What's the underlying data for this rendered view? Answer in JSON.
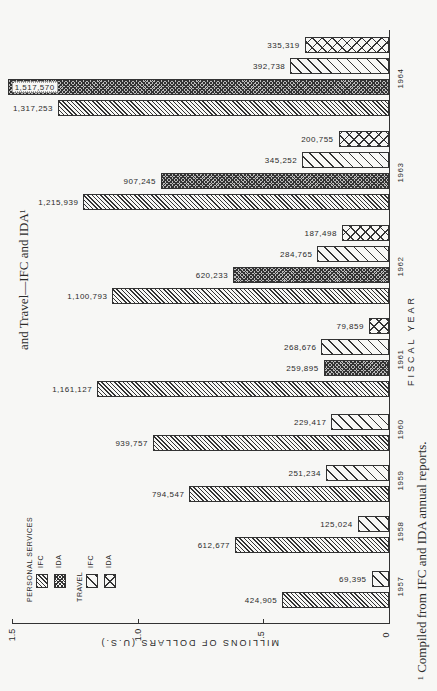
{
  "title": "and Travel—IFC and IDA¹",
  "footnote": "¹ Compiled from IFC and IDA annual reports.",
  "axis": {
    "value_label": "MILLIONS OF DOLLARS (U.S.)",
    "category_label": "FISCAL YEAR",
    "ticks": [
      "0",
      ".5",
      "1.0",
      "1.5"
    ]
  },
  "legend": {
    "group1": "PERSONAL SERVICES",
    "group2": "TRAVEL",
    "items": [
      {
        "label": "IFC",
        "pattern": "pat-ps-ifc"
      },
      {
        "label": "IDA",
        "pattern": "pat-ps-ida"
      },
      {
        "label": "IFC",
        "pattern": "pat-tr-ifc"
      },
      {
        "label": "IDA",
        "pattern": "pat-tr-ida"
      }
    ]
  },
  "colors": {
    "ink": "#333333",
    "paper": "#f7f7f5"
  },
  "chart_data": {
    "type": "bar",
    "orientation": "horizontal (page rotated 90°)",
    "xlabel": "FISCAL YEAR",
    "ylabel": "MILLIONS OF DOLLARS (U.S.)",
    "ylim": [
      0,
      1.5
    ],
    "yticks": [
      0,
      0.5,
      1.0,
      1.5
    ],
    "grid": false,
    "legend_position": "upper-left (rotated)",
    "categories": [
      "1957",
      "1958",
      "1959",
      "1960",
      "1961",
      "1962",
      "1963",
      "1964"
    ],
    "series": [
      {
        "name": "Personal Services — IFC",
        "values": [
          424905,
          612677,
          794547,
          939757,
          1161127,
          1100793,
          1215939,
          1317253
        ]
      },
      {
        "name": "Personal Services — IDA",
        "values": [
          null,
          null,
          null,
          null,
          259895,
          620233,
          907245,
          1517570
        ]
      },
      {
        "name": "Travel — IFC",
        "values": [
          69395,
          125024,
          251234,
          229417,
          268676,
          284765,
          345252,
          392738
        ]
      },
      {
        "name": "Travel — IDA",
        "values": [
          null,
          null,
          null,
          null,
          79859,
          187498,
          200755,
          335319
        ]
      }
    ],
    "value_labels": {
      "1957": [
        "424,905",
        null,
        "69,395",
        null
      ],
      "1958": [
        "612,677",
        null,
        "125,024",
        null
      ],
      "1959": [
        "794,547",
        null,
        "251,234",
        null
      ],
      "1960": [
        "939,757",
        null,
        "229,417",
        null
      ],
      "1961": [
        "1,161,127",
        "259,895",
        "268,676",
        "79,859"
      ],
      "1962": [
        "1,100,793",
        "620,233",
        "284,765",
        "187,498"
      ],
      "1963": [
        "1,215,939",
        "907,245",
        "345,252",
        "200,755"
      ],
      "1964": [
        "1,317,253",
        "1,517,570",
        "392,738",
        "335,319"
      ]
    }
  }
}
